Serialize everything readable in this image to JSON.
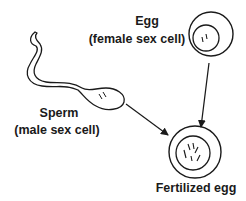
{
  "diagram": {
    "egg": {
      "title": "Egg",
      "subtitle": "(female sex cell)"
    },
    "sperm": {
      "title": "Sperm",
      "subtitle": "(male sex cell)"
    },
    "fertilized_egg": {
      "title": "Fertilized egg"
    },
    "colors": {
      "stroke": "#1a1a1a",
      "background": "#ffffff"
    }
  }
}
